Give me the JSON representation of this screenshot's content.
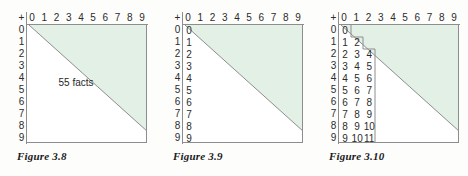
{
  "page": {
    "background_color": "#fdfdfc",
    "shade_color": "#e3f0e6",
    "line_color": "#8d8d8d",
    "text_color": "#2b2b2b"
  },
  "figures": [
    {
      "id": "figure-3-8",
      "caption": "Figure 3.8",
      "corner_label": "+",
      "column_headers": [
        "0",
        "1",
        "2",
        "3",
        "4",
        "5",
        "6",
        "7",
        "8",
        "9"
      ],
      "row_headers": [
        "0",
        "1",
        "2",
        "3",
        "4",
        "5",
        "6",
        "7",
        "8",
        "9"
      ],
      "note": "55 facts",
      "shaded_region": "upper-right-triangle",
      "inner_rows": []
    },
    {
      "id": "figure-3-9",
      "caption": "Figure 3.9",
      "corner_label": "+",
      "column_headers": [
        "0",
        "1",
        "2",
        "3",
        "4",
        "5",
        "6",
        "7",
        "8",
        "9"
      ],
      "row_headers": [
        "0",
        "1",
        "2",
        "3",
        "4",
        "5",
        "6",
        "7",
        "8",
        "9"
      ],
      "note": "",
      "shaded_region": "upper-right-triangle",
      "inner_rows": [
        [
          "0"
        ],
        [
          "1"
        ],
        [
          "2"
        ],
        [
          "3"
        ],
        [
          "4"
        ],
        [
          "5"
        ],
        [
          "6"
        ],
        [
          "7"
        ],
        [
          "8"
        ],
        [
          "9"
        ]
      ]
    },
    {
      "id": "figure-3-10",
      "caption": "Figure 3.10",
      "corner_label": "+",
      "column_headers": [
        "0",
        "1",
        "2",
        "3",
        "4",
        "5",
        "6",
        "7",
        "8",
        "9"
      ],
      "row_headers": [
        "0",
        "1",
        "2",
        "3",
        "4",
        "5",
        "6",
        "7",
        "8",
        "9"
      ],
      "note": "",
      "shaded_region": "upper-right-triangle",
      "inner_rows": [
        [
          "0"
        ],
        [
          "1",
          "2"
        ],
        [
          "2",
          "3",
          "4"
        ],
        [
          "3",
          "4",
          "5"
        ],
        [
          "4",
          "5",
          "6"
        ],
        [
          "5",
          "6",
          "7"
        ],
        [
          "6",
          "7",
          "8"
        ],
        [
          "7",
          "8",
          "9"
        ],
        [
          "8",
          "9",
          "10"
        ],
        [
          "9",
          "10",
          "11"
        ]
      ]
    }
  ]
}
